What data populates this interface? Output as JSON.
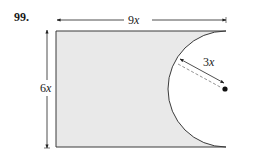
{
  "problem": {
    "number": "99."
  },
  "figure": {
    "shape": "rectangle with semicircle removed from right side",
    "fill_color": "#e9e9e9",
    "stroke_color": "#3a3a3a",
    "rectangle": {
      "width_label": "9",
      "width_var": "x",
      "height_label": "6",
      "height_var": "x"
    },
    "semicircle": {
      "radius_label": "3",
      "radius_var": "x"
    },
    "dimensions": [
      {
        "name": "width",
        "value": "9x"
      },
      {
        "name": "height",
        "value": "6x"
      },
      {
        "name": "radius",
        "value": "3x"
      }
    ]
  }
}
